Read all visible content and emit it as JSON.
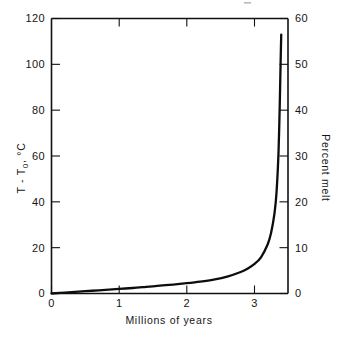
{
  "chart_data": {
    "type": "line",
    "title": "",
    "xlabel": "Millions of years",
    "ylabel_left": "T - T0, °C",
    "ylabel_right": "Percent melt",
    "xlim": [
      0,
      3.5
    ],
    "ylim_left": [
      0,
      120
    ],
    "ylim_right": [
      0,
      60
    ],
    "grid": false,
    "legend": "none",
    "x_ticks": [
      "0",
      "1",
      "2",
      "3"
    ],
    "x_tick_values": [
      0,
      1,
      2,
      3
    ],
    "y_ticks_left": [
      "0",
      "20",
      "40",
      "60",
      "80",
      "100",
      "120"
    ],
    "y_tick_values_left": [
      0,
      20,
      40,
      60,
      80,
      100,
      120
    ],
    "y_ticks_right": [
      "0",
      "10",
      "20",
      "30",
      "40",
      "50",
      "60"
    ],
    "y_tick_values_right": [
      0,
      10,
      20,
      30,
      40,
      50,
      60
    ],
    "series": [
      {
        "name": "temperature rise",
        "x": [
          0.0,
          0.2,
          0.4,
          0.6,
          0.8,
          1.0,
          1.2,
          1.4,
          1.6,
          1.8,
          2.0,
          2.2,
          2.4,
          2.6,
          2.8,
          2.9,
          3.0,
          3.1,
          3.2,
          3.25,
          3.3,
          3.33,
          3.36,
          3.38,
          3.39,
          3.4
        ],
        "values": [
          0.0,
          0.4,
          0.8,
          1.2,
          1.6,
          2.0,
          2.4,
          2.9,
          3.4,
          3.9,
          4.5,
          5.2,
          6.1,
          7.4,
          9.4,
          10.8,
          12.8,
          15.8,
          21.5,
          26.5,
          35.0,
          44.0,
          62.0,
          85.0,
          100.0,
          113.0
        ]
      }
    ],
    "right_axis_scale_note": "percent melt = (T - T0) / 2"
  },
  "axis_labels": {
    "x_title": "Millions of years",
    "y_left_main": "T - T",
    "y_left_sub": "0",
    "y_left_unit": ", °C",
    "y_right_title": "Percent melt"
  },
  "colors": {
    "curve": "#0d0d0d",
    "axis": "#111111",
    "background": "#ffffff",
    "text": "#151515"
  }
}
